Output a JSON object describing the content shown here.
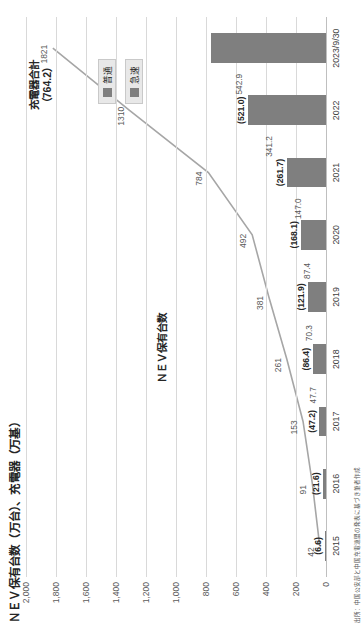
{
  "figure": {
    "axis_title": "ＮＥＶ保有台数（万台）、充電器（万基）",
    "source_note": "出所：中国公安部と中国充電連盟の発表に基づき筆者作成",
    "line_series_label": "ＮＥＶ保有台数",
    "bar_total_label_line1": "充電器合計",
    "bar_total_label_line2": "（764.2）"
  },
  "legend": {
    "items": [
      {
        "label": "普通",
        "color": "#7f7f7f"
      },
      {
        "label": "急速",
        "color": "#7f7f7f"
      }
    ]
  },
  "chart_data": {
    "type": "bar",
    "title": "ＮＥＶ保有台数（万台）、充電器（万基）",
    "xlabel": "",
    "ylabel": "ＮＥＶ保有台数（万台）、充電器（万基）",
    "ylim": [
      0,
      2000
    ],
    "yticks": [
      "0",
      "200",
      "400",
      "600",
      "800",
      "1,000",
      "1,200",
      "1,400",
      "1,600",
      "1,800",
      "2,000"
    ],
    "ytick_values": [
      0,
      200,
      400,
      600,
      800,
      1000,
      1200,
      1400,
      1600,
      1800,
      2000
    ],
    "grid": true,
    "legend_position": "upper-right-inside",
    "categories": [
      "2015",
      "2016",
      "2017",
      "2018",
      "2019",
      "2020",
      "2021",
      "2022",
      "2023/9/30"
    ],
    "series": [
      {
        "name": "ＮＥＶ保有台数",
        "type": "line",
        "color": "#a6a6a6",
        "values": [
          42,
          91,
          153,
          261,
          381,
          492,
          784,
          1310,
          1821
        ],
        "labels": [
          "42",
          "91",
          "153",
          "261",
          "381",
          "492",
          "784",
          "1310",
          "1821"
        ]
      },
      {
        "name": "充電器合計",
        "type": "bar",
        "color": "#7f7f7f",
        "values": [
          6.6,
          21.6,
          47.2,
          86.4,
          121.9,
          168.1,
          261.7,
          521.0,
          764.2
        ],
        "labels": [
          "(6.6)",
          "(21.6)",
          "(47.2)",
          "(86.4)",
          "(121.9)",
          "(168.1)",
          "(261.7)",
          "(521.0)",
          "(764.2)"
        ]
      },
      {
        "name": "普通",
        "type": "annotation",
        "values": [
          null,
          null,
          47.7,
          70.3,
          87.4,
          147.0,
          341.2,
          542.9,
          null
        ],
        "labels": [
          "",
          "",
          "47.7",
          "70.3",
          "87.4",
          "147.0",
          "341.2",
          "542.9",
          ""
        ]
      }
    ]
  }
}
